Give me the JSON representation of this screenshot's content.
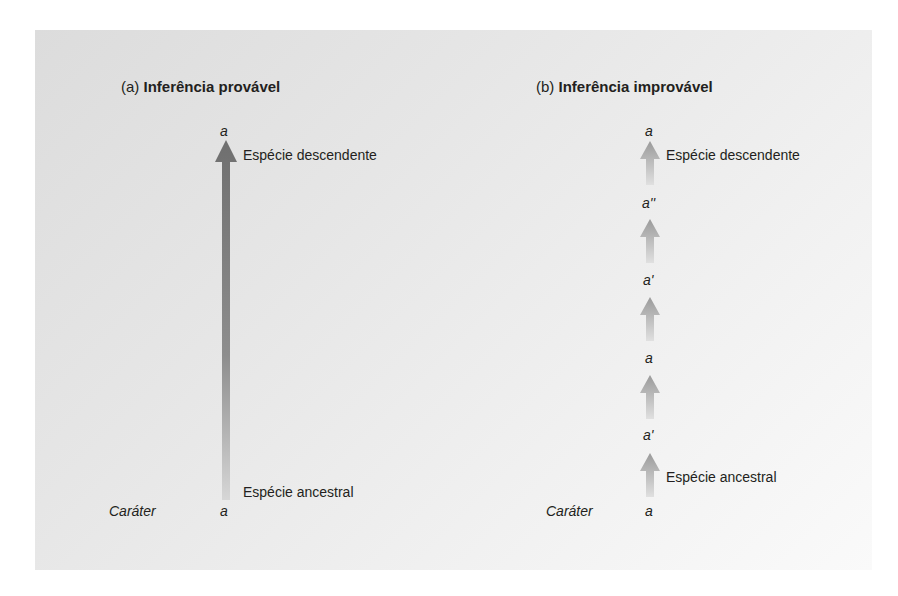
{
  "panel_a": {
    "prefix": "(a)",
    "title": "Inferência provável",
    "character_label": "Caráter",
    "top_state": "a",
    "bottom_state": "a",
    "descendant_label": "Espécie descendente",
    "ancestral_label": "Espécie ancestral"
  },
  "panel_b": {
    "prefix": "(b)",
    "title": "Inferência improvável",
    "character_label": "Caráter",
    "states": [
      "a",
      "a'",
      "a",
      "a'",
      "a''",
      "a"
    ],
    "descendant_label": "Espécie descendente",
    "ancestral_label": "Espécie ancestral"
  },
  "colors": {
    "arrow_dark": "#7a7a7a",
    "arrow_light": "#b5b5b5",
    "text": "#231f20"
  }
}
